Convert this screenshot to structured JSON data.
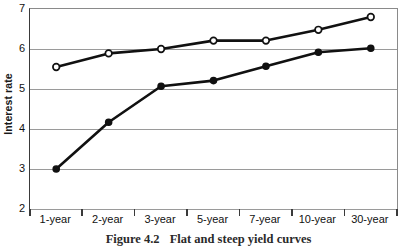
{
  "chart_data": {
    "type": "line",
    "title": "",
    "xlabel": "",
    "ylabel": "Interest rate",
    "categories": [
      "1-year",
      "2-year",
      "3-year",
      "5-year",
      "7-year",
      "10-year",
      "30-year"
    ],
    "ylim": [
      2,
      7
    ],
    "yticks": [
      2,
      3,
      4,
      5,
      6,
      7
    ],
    "ytick_labels": [
      "2",
      "3",
      "4",
      "5",
      "6",
      "7"
    ],
    "grid": "horizontal",
    "legend_position": "none",
    "series": [
      {
        "name": "Flat yield curve",
        "marker": "open-circle",
        "values": [
          5.55,
          5.89,
          6.0,
          6.21,
          6.21,
          6.48,
          6.8
        ]
      },
      {
        "name": "Steep yield curve",
        "marker": "filled-circle",
        "values": [
          3.0,
          4.17,
          5.07,
          5.21,
          5.57,
          5.92,
          6.02
        ]
      }
    ]
  },
  "axes": {
    "y_title": "Interest rate"
  },
  "caption": {
    "label": "Figure 4.2",
    "text": "Flat and steep yield curves"
  },
  "colors": {
    "line": "#111111",
    "gridline": "#9a9a9a",
    "frame": "#3a3a3a",
    "background": "#ffffff",
    "text": "#111111"
  }
}
